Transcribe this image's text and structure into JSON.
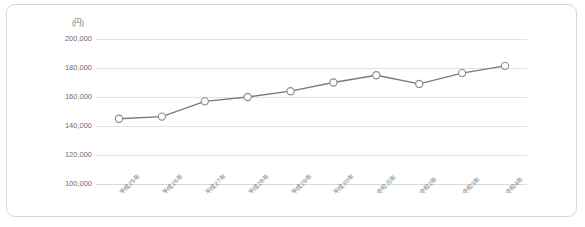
{
  "chart_data": {
    "type": "line",
    "title": "",
    "unit_label": "(円)",
    "xlabel": "",
    "ylabel": "",
    "ylim": [
      100000,
      200000
    ],
    "ytick_step": 20000,
    "ytick_labels": [
      "200,000",
      "180,000",
      "160,000",
      "140,000",
      "120,000",
      "100,000"
    ],
    "ytick_values": [
      200000,
      180000,
      160000,
      140000,
      120000,
      100000
    ],
    "grid": true,
    "legend": "none",
    "categories": [
      "平成25年",
      "平成26年",
      "平成27年",
      "平成28年",
      "平成29年",
      "平成30年",
      "令和元年",
      "令和2年",
      "令和3年",
      "令和4年"
    ],
    "values": [
      145000,
      146500,
      157000,
      160000,
      164000,
      170000,
      175000,
      169000,
      176500,
      181500
    ],
    "series": [
      {
        "name": "",
        "values": [
          145000,
          146500,
          157000,
          160000,
          164000,
          170000,
          175000,
          169000,
          176500,
          181500
        ]
      }
    ],
    "colors": {
      "line": "#7a7a7a",
      "marker_fill": "#ffffff",
      "marker_stroke": "#8a8a8a",
      "grid": "#e2e2e2",
      "axis_text": "#6e6e6e",
      "panel_border": "#d6d6d6",
      "background": "#ffffff"
    }
  }
}
